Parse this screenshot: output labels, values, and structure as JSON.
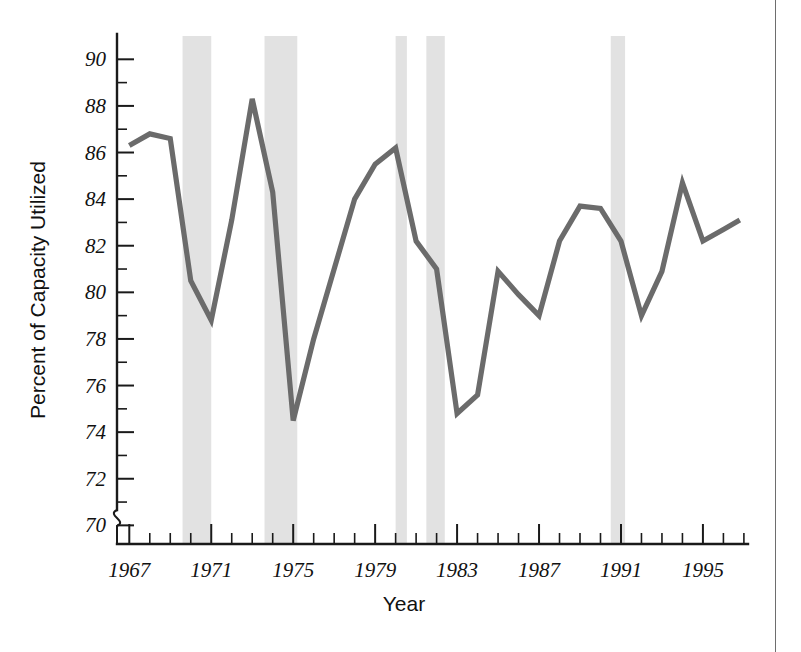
{
  "chart_data": {
    "type": "line",
    "title": "",
    "xlabel": "Year",
    "ylabel": "Percent of Capacity Utilized",
    "xlim": [
      1966.4,
      1997.2
    ],
    "ylim": [
      69.2,
      91.0
    ],
    "y_axis_break": true,
    "y_axis_break_symbol": "~",
    "grid": false,
    "legend": "none",
    "y_ticks_major": [
      70,
      72,
      74,
      76,
      78,
      80,
      82,
      84,
      86,
      88,
      90
    ],
    "y_tick_labels": [
      "70",
      "72",
      "74",
      "76",
      "78",
      "80",
      "82",
      "84",
      "86",
      "88",
      "90"
    ],
    "y_ticks_minor": [
      71,
      73,
      75,
      77,
      79,
      81,
      83,
      85,
      87,
      89
    ],
    "x_ticks_major": [
      1967,
      1971,
      1975,
      1979,
      1983,
      1987,
      1991,
      1995
    ],
    "x_tick_labels": [
      "1967",
      "1971",
      "1975",
      "1979",
      "1983",
      "1987",
      "1991",
      "1995"
    ],
    "x_ticks_minor": [
      1968,
      1969,
      1970,
      1972,
      1973,
      1974,
      1976,
      1977,
      1978,
      1980,
      1981,
      1982,
      1984,
      1985,
      1986,
      1988,
      1989,
      1990,
      1992,
      1993,
      1994,
      1996,
      1997
    ],
    "line_color": "#6b6b6b",
    "band_color": "#e2e2e2",
    "x": [
      1967,
      1968,
      1969,
      1970,
      1971,
      1972,
      1973,
      1974,
      1975,
      1976,
      1977,
      1978,
      1979,
      1980,
      1981,
      1982,
      1983,
      1984,
      1985,
      1986,
      1987,
      1988,
      1989,
      1990,
      1991,
      1992,
      1993,
      1994,
      1995,
      1996
    ],
    "values": [
      86.3,
      86.8,
      86.6,
      80.5,
      78.8,
      83.1,
      88.3,
      84.3,
      74.5,
      78.0,
      81.0,
      84.0,
      85.5,
      86.2,
      82.2,
      81.0,
      74.8,
      75.6,
      80.9,
      79.9,
      79.0,
      82.2,
      83.7,
      83.6,
      82.2,
      79.0,
      80.9,
      84.7,
      82.2,
      82.7
    ],
    "last_point": {
      "x": 1996.8,
      "value": 83.1
    },
    "recession_bands": [
      {
        "start": 1969.6,
        "end": 1971.0
      },
      {
        "start": 1973.6,
        "end": 1975.2
      },
      {
        "start": 1980.0,
        "end": 1980.55
      },
      {
        "start": 1981.5,
        "end": 1982.4
      },
      {
        "start": 1990.5,
        "end": 1991.2
      }
    ]
  }
}
